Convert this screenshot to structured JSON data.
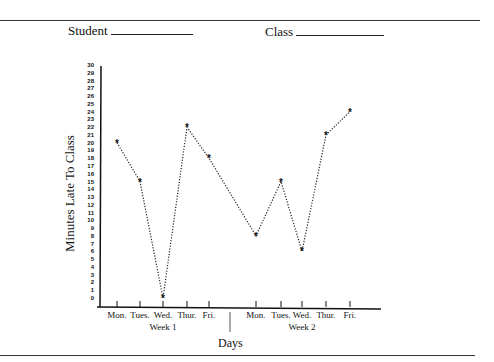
{
  "header": {
    "student_label": "Student",
    "class_label": "Class"
  },
  "chart_data": {
    "type": "line",
    "title": "",
    "xlabel": "Days",
    "ylabel": "Minutes Late To Class",
    "ylim": [
      0,
      30
    ],
    "yticks": [
      "0",
      "1",
      "2",
      "3",
      "4",
      "5",
      "6",
      "7",
      "8",
      "9",
      "10",
      "11",
      "12",
      "13",
      "14",
      "15",
      "16",
      "17",
      "18",
      "19",
      "20",
      "21",
      "22",
      "23",
      "24",
      "25",
      "26",
      "27",
      "28",
      "29",
      "30"
    ],
    "grid": false,
    "legend": null,
    "marker": "*",
    "line_style": "dotted",
    "groups": [
      {
        "name": "Week 1",
        "categories": [
          "Mon.",
          "Tues.",
          "Wed.",
          "Thur.",
          "Fri."
        ],
        "values": [
          20,
          15,
          0,
          22,
          18
        ]
      },
      {
        "name": "Week 2",
        "categories": [
          "Mon.",
          "Tues.",
          "Wed.",
          "Thur.",
          "Fri."
        ],
        "values": [
          8,
          15,
          6,
          21,
          24
        ]
      }
    ],
    "categories": [
      "Mon.",
      "Tues.",
      "Wed.",
      "Thur.",
      "Fri.",
      "Mon.",
      "Tues.",
      "Wed.",
      "Thur.",
      "Fri."
    ],
    "series": [
      {
        "name": "Minutes Late",
        "values": [
          20,
          15,
          0,
          22,
          18,
          8,
          15,
          6,
          21,
          24
        ]
      }
    ]
  }
}
